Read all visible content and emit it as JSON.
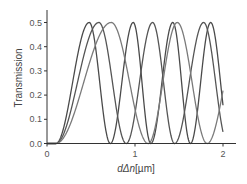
{
  "chart_data": {
    "type": "line",
    "title": "",
    "xlabel": "dΔn[µm]",
    "xlabel_parts": {
      "italic": "dΔn",
      "rest": "[µm]"
    },
    "ylabel": "Transmission",
    "xlim": [
      0,
      2.1
    ],
    "ylim": [
      0,
      0.55
    ],
    "x_ticks": [
      0,
      1,
      2
    ],
    "x_tick_labels": [
      "0",
      "1",
      "2"
    ],
    "y_ticks": [
      0.0,
      0.1,
      0.2,
      0.3,
      0.4,
      0.5
    ],
    "y_tick_labels": [
      "0.0",
      "0.1",
      "0.2",
      "0.3",
      "0.4",
      "0.5"
    ],
    "grid": false,
    "legend": null,
    "amplitude": 0.5,
    "series": [
      {
        "name": "curve-1",
        "color": "#4a4a4a",
        "peaks_x": [
          0.48,
          0.98,
          1.43,
          1.86
        ],
        "phase_knots_x": [
          0.1,
          0.48,
          0.72,
          0.98,
          1.18,
          1.43,
          1.63,
          1.86,
          2.0
        ],
        "phase_knots_halfpi": [
          0,
          1,
          2,
          3,
          4,
          5,
          6,
          7,
          7.62
        ],
        "end_value": 0.16
      },
      {
        "name": "curve-2",
        "color": "#555555",
        "peaks_x": [
          0.59,
          1.2,
          1.78
        ],
        "phase_knots_x": [
          0.1,
          0.59,
          0.9,
          1.2,
          1.45,
          1.78,
          2.0
        ],
        "phase_knots_halfpi": [
          0,
          1,
          2,
          3,
          4,
          5,
          5.8
        ],
        "end_value": 0.045
      },
      {
        "name": "curve-3",
        "color": "#7a7a7a",
        "peaks_x": [
          0.73,
          1.48
        ],
        "phase_knots_x": [
          0.1,
          0.73,
          1.15,
          1.48,
          1.82,
          2.0
        ],
        "phase_knots_halfpi": [
          0,
          1,
          2,
          3,
          4,
          4.46
        ],
        "end_value": 0.22
      }
    ]
  }
}
